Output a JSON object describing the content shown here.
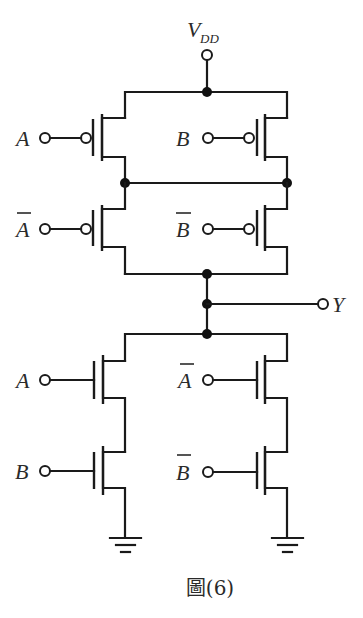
{
  "figure": {
    "caption": "圖(6)"
  },
  "supply": {
    "label_main": "V",
    "label_sub": "DD"
  },
  "output": {
    "label": "Y"
  },
  "pull_up": [
    {
      "id": "p1",
      "type": "PMOS",
      "input": "A",
      "inverted": false,
      "position": "top-left"
    },
    {
      "id": "p2",
      "type": "PMOS",
      "input": "B",
      "inverted": false,
      "position": "top-right"
    },
    {
      "id": "p3",
      "type": "PMOS",
      "input": "A",
      "inverted": true,
      "position": "bottom-left"
    },
    {
      "id": "p4",
      "type": "PMOS",
      "input": "B",
      "inverted": true,
      "position": "bottom-right"
    }
  ],
  "pull_down": [
    {
      "id": "n1",
      "type": "NMOS",
      "input": "A",
      "inverted": false,
      "position": "top-left"
    },
    {
      "id": "n2",
      "type": "NMOS",
      "input": "B",
      "inverted": false,
      "position": "bottom-left"
    },
    {
      "id": "n3",
      "type": "NMOS",
      "input": "A",
      "inverted": true,
      "position": "top-right"
    },
    {
      "id": "n4",
      "type": "NMOS",
      "input": "B",
      "inverted": true,
      "position": "bottom-right"
    }
  ],
  "labels": {
    "p1": "A",
    "p2": "B",
    "p3": "A",
    "p4": "B",
    "n1": "A",
    "n2": "B",
    "n3": "A",
    "n4": "B"
  },
  "colors": {
    "ink": "#1a1a1a",
    "background": "#ffffff"
  }
}
